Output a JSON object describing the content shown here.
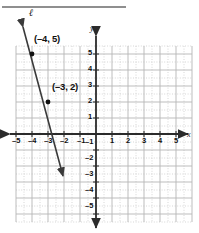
{
  "figure": {
    "title_rule": "horizontal-rule",
    "line_label": "ℓ",
    "points": [
      {
        "label": "(–4, 5)",
        "x": -4,
        "y": 5
      },
      {
        "label": "(–3, 2)",
        "x": -3,
        "y": 2
      }
    ],
    "axis_labels": {
      "x": "x",
      "y": "y"
    },
    "colors": {
      "axis": "#2b2b2b",
      "grid_major": "#b9b9b9",
      "grid_minor": "#c9c9c9",
      "line": "#3a3a3a",
      "rule": "#8f8f8f",
      "text": "#101010"
    }
  },
  "chart_data": {
    "type": "line",
    "title": "",
    "xlabel": "x",
    "ylabel": "y",
    "xlim": [
      -5.5,
      5.5
    ],
    "ylim": [
      -5.5,
      5.5
    ],
    "xticks": [
      -5,
      -4,
      -3,
      -2,
      -1,
      1,
      2,
      3,
      4,
      5
    ],
    "yticks": [
      5,
      4,
      3,
      2,
      1,
      -1,
      -2,
      -3,
      -4,
      -5
    ],
    "xtick_labels": [
      "–5",
      "–4",
      "–3",
      "–2",
      "–1",
      "1",
      "2",
      "3",
      "4",
      "5"
    ],
    "ytick_labels": [
      "5",
      "4",
      "3",
      "2",
      "1",
      "–1",
      "–2",
      "–3",
      "–4",
      "–5"
    ],
    "grid": true,
    "grid_minor_step": 0.5,
    "legend": false,
    "series": [
      {
        "name": "ℓ",
        "type": "line",
        "slope": -3,
        "intercept": -7,
        "endpoints": [
          [
            -4.55,
            6.65
          ],
          [
            -2.1,
            -2.7
          ]
        ],
        "arrows": [
          "start",
          "end"
        ],
        "points": [
          {
            "x": -4,
            "y": 5,
            "label": "(–4, 5)"
          },
          {
            "x": -3,
            "y": 2,
            "label": "(–3, 2)"
          }
        ]
      }
    ],
    "annotations": [
      {
        "text": "ℓ",
        "x": -4.2,
        "y": 7.0
      },
      {
        "text": "(–4, 5)",
        "x": -3.6,
        "y": 5.9
      },
      {
        "text": "(–3, 2)",
        "x": -2.5,
        "y": 2.9
      }
    ]
  },
  "ticks": {
    "x": [
      {
        "label": "–5",
        "left": 12,
        "top": 136
      },
      {
        "label": "–4",
        "left": 28,
        "top": 136
      },
      {
        "label": "–3",
        "left": 44,
        "top": 136
      },
      {
        "label": "–2",
        "left": 60,
        "top": 136
      },
      {
        "label": "–1",
        "left": 77,
        "top": 136
      },
      {
        "label": "1",
        "left": 110,
        "top": 136
      },
      {
        "label": "2",
        "left": 126,
        "top": 136
      },
      {
        "label": "3",
        "left": 142,
        "top": 136
      },
      {
        "label": "4",
        "left": 158,
        "top": 136
      },
      {
        "label": "5",
        "left": 174,
        "top": 136
      }
    ],
    "y": [
      {
        "label": "5",
        "left": 88,
        "top": 48
      },
      {
        "label": "4",
        "left": 88,
        "top": 64
      },
      {
        "label": "3",
        "left": 88,
        "top": 80
      },
      {
        "label": "2",
        "left": 88,
        "top": 96
      },
      {
        "label": "1",
        "left": 88,
        "top": 112
      },
      {
        "label": "–1",
        "left": 85,
        "top": 137
      },
      {
        "label": "–2",
        "left": 85,
        "top": 153
      },
      {
        "label": "–3",
        "left": 85,
        "top": 169
      },
      {
        "label": "–4",
        "left": 85,
        "top": 185
      },
      {
        "label": "–5",
        "left": 85,
        "top": 201
      }
    ]
  }
}
